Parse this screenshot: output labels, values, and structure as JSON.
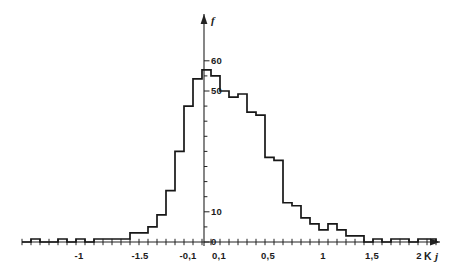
{
  "figure": {
    "background": "#ffffff",
    "ink_color": "#171717"
  },
  "chart_data": {
    "type": "bar",
    "title": "",
    "subtitle": "",
    "xlabel": "K j",
    "ylabel": "f",
    "grid": false,
    "legend": null,
    "annotations": [],
    "xlim": [
      -2.3,
      2.3
    ],
    "ylim": [
      0,
      64
    ],
    "xtick_labels": [
      "-1",
      "-1.5",
      "-0,1",
      "0,1",
      "0,5",
      "1",
      "1,5",
      "2"
    ],
    "xtick_values": [
      -1.6,
      -0.95,
      -0.2,
      0.18,
      0.82,
      1.45,
      2.05,
      2.6
    ],
    "ytick_labels": [
      "0",
      "10",
      "50",
      "60"
    ],
    "ytick_values": [
      0,
      10,
      50,
      60
    ],
    "yminor_step": 5,
    "bin_width": 0.1,
    "categories": [
      "-2.25",
      "-2.15",
      "-2.05",
      "-1.95",
      "-1.85",
      "-1.75",
      "-1.65",
      "-1.55",
      "-1.45",
      "-1.35",
      "-1.25",
      "-1.15",
      "-1.05",
      "-0.95",
      "-0.85",
      "-0.75",
      "-0.65",
      "-0.55",
      "-0.45",
      "-0.35",
      "-0.25",
      "-0.15",
      "-0.05",
      "0.05",
      "0.15",
      "0.25",
      "0.35",
      "0.45",
      "0.55",
      "0.65",
      "0.75",
      "0.85",
      "0.95",
      "1.05",
      "1.15",
      "1.25",
      "1.35",
      "1.45",
      "1.55",
      "1.65",
      "1.75",
      "1.85",
      "1.95",
      "2.05",
      "2.15",
      "2.25"
    ],
    "values": [
      0,
      1,
      0,
      0,
      1,
      0,
      1,
      0,
      1,
      1,
      1,
      1,
      3,
      3,
      5,
      9,
      17,
      30,
      45,
      54,
      57,
      55,
      50,
      48,
      49,
      43,
      42,
      28,
      27,
      13,
      12,
      8,
      6,
      4,
      6,
      4,
      2,
      2,
      0,
      1,
      0,
      1,
      1,
      0,
      1,
      1
    ],
    "x_axis_note": "compressed non-linear scan axis; labels use comma decimal separator"
  },
  "axis_labels": {
    "x_name": "K",
    "x_name_sub": "j",
    "y_name": "f"
  }
}
